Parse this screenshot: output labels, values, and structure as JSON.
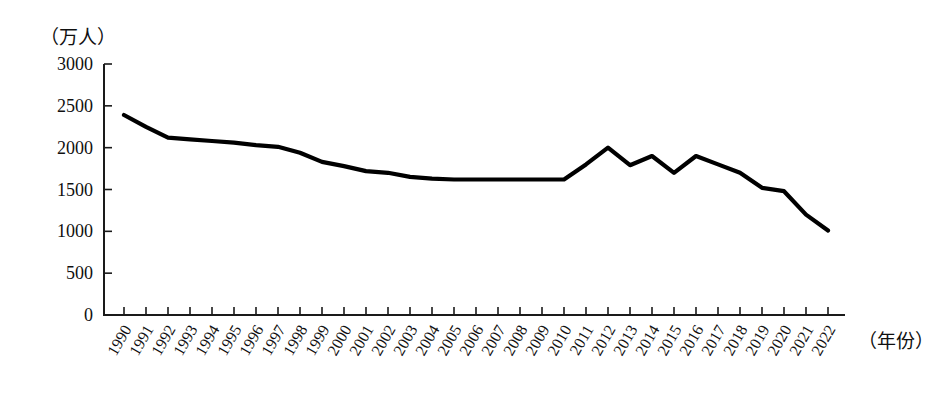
{
  "chart_data": {
    "type": "line",
    "title": "",
    "subtitle": "",
    "xlabel": "（年份）",
    "ylabel": "（万人）",
    "ylim": [
      0,
      3000
    ],
    "yticks": [
      0,
      500,
      1000,
      1500,
      2000,
      2500,
      3000
    ],
    "ytick_labels": [
      "0",
      "500",
      "1000",
      "1500",
      "2000",
      "2500",
      "3000"
    ],
    "grid": false,
    "legend": null,
    "legend_position": "none",
    "categories": [
      "1990",
      "1991",
      "1992",
      "1993",
      "1994",
      "1995",
      "1996",
      "1997",
      "1998",
      "1999",
      "2000",
      "2001",
      "2002",
      "2003",
      "2004",
      "2005",
      "2006",
      "2007",
      "2008",
      "2009",
      "2010",
      "2011",
      "2012",
      "2013",
      "2014",
      "2015",
      "2016",
      "2017",
      "2018",
      "2019",
      "2020",
      "2021",
      "2022"
    ],
    "values": [
      2390,
      2250,
      2120,
      2100,
      2080,
      2060,
      2030,
      2010,
      1940,
      1830,
      1780,
      1720,
      1700,
      1650,
      1630,
      1620,
      1620,
      1620,
      1620,
      1620,
      1620,
      1800,
      2000,
      1790,
      1900,
      1700,
      1900,
      1800,
      1700,
      1520,
      1480,
      1200,
      1010
    ],
    "series": [
      {
        "name": "出生人口",
        "color": "#000000",
        "values": [
          2390,
          2250,
          2120,
          2100,
          2080,
          2060,
          2030,
          2010,
          1940,
          1830,
          1780,
          1720,
          1700,
          1650,
          1630,
          1620,
          1620,
          1620,
          1620,
          1620,
          1620,
          1800,
          2000,
          1790,
          1900,
          1700,
          1900,
          1800,
          1700,
          1520,
          1480,
          1200,
          1010
        ]
      }
    ],
    "annotations": []
  },
  "axes": {
    "y_unit_label": "（万人）",
    "x_unit_label": "（年份）"
  },
  "colors": {
    "line": "#000000",
    "axis": "#1a1a1a",
    "text": "#101010",
    "background": "#ffffff"
  }
}
